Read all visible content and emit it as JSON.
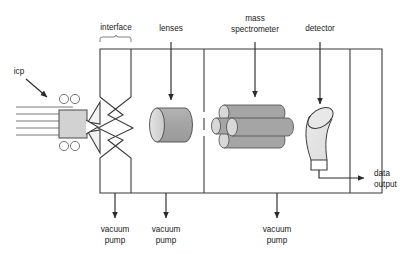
{
  "diagram": {
    "background_color": "#ffffff",
    "line_color": "#3b3b3b",
    "body_fill": "#a8a8a8",
    "face_fill": "#d8d8d8",
    "torch_fill": "#d0d0d0",
    "labels": {
      "icp": "icp",
      "interface": "interface",
      "lenses": "lenses",
      "mass_spectrometer_line1": "mass",
      "mass_spectrometer_line2": "spectrometer",
      "detector": "detector",
      "data_output_line1": "data",
      "data_output_line2": "output",
      "vacuum_pump_1_line1": "vacuum",
      "vacuum_pump_1_line2": "pump",
      "vacuum_pump_2_line1": "vacuum",
      "vacuum_pump_2_line2": "pump",
      "vacuum_pump_3_line1": "vacuum",
      "vacuum_pump_3_line2": "pump"
    },
    "components": {
      "icp_torch": "icp-torch",
      "load_coil_circles": 4,
      "plasma_gas_lines": 5,
      "sampler_cone": "sampler-cone",
      "skimmer_cone": "skimmer-cone",
      "ion_lens": "ion-lens-cylinder",
      "quadrupole_rods": 4,
      "electron_multiplier": "detector-horn"
    }
  }
}
